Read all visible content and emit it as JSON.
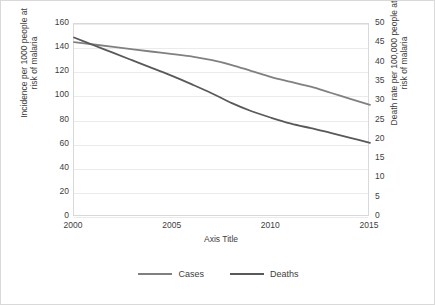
{
  "chart_data": {
    "type": "line",
    "title": "",
    "xlabel": "Axis Title",
    "ylabel": "Incidence per 1000 people at risk of malaria",
    "y2label": "Death rate per 100,000 people at risk of malaria",
    "xlim": [
      2000,
      2015
    ],
    "ylim": [
      0,
      160
    ],
    "y2lim": [
      0,
      50
    ],
    "grid": true,
    "legend_position": "bottom",
    "xticks": [
      "2000",
      "2005",
      "2010",
      "2015"
    ],
    "xtick_values": [
      2000,
      2005,
      2010,
      2015
    ],
    "yticks": [
      "0",
      "20",
      "40",
      "60",
      "80",
      "100",
      "120",
      "140",
      "160"
    ],
    "ytick_values": [
      0,
      20,
      40,
      60,
      80,
      100,
      120,
      140,
      160
    ],
    "y2ticks": [
      "0",
      "5",
      "10",
      "15",
      "20",
      "25",
      "30",
      "35",
      "40",
      "45",
      "50"
    ],
    "y2tick_values": [
      0,
      5,
      10,
      15,
      20,
      25,
      30,
      35,
      40,
      45,
      50
    ],
    "x": [
      2000,
      2001,
      2002,
      2003,
      2004,
      2005,
      2006,
      2007,
      2008,
      2009,
      2010,
      2011,
      2012,
      2013,
      2014,
      2015
    ],
    "series": [
      {
        "name": "Cases",
        "axis": "left",
        "color": "#808080",
        "values": [
          145,
          143,
          141,
          139,
          137,
          135,
          133,
          130,
          126,
          121,
          116,
          112,
          108,
          103,
          98,
          93
        ]
      },
      {
        "name": "Deaths",
        "axis": "right",
        "color": "#595959",
        "values": [
          46.5,
          44.5,
          42.5,
          40.5,
          38.5,
          36.5,
          34.3,
          32.0,
          29.5,
          27.4,
          25.7,
          24.2,
          23.0,
          21.8,
          20.5,
          19.2
        ]
      }
    ]
  },
  "axis_titles": {
    "y_left_line1": "Incidence per 1000 people at",
    "y_left_line2": "risk of malaria",
    "y_right_line1": "Death rate per 100,000 people at",
    "y_right_line2": "risk of malaria",
    "x": "Axis Title"
  },
  "colors": {
    "cases": "#808080",
    "deaths": "#595959",
    "gridline": "#ebebeb",
    "axis_text": "#404040",
    "frame": "#d9d9d9"
  }
}
